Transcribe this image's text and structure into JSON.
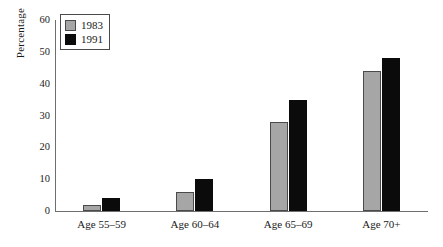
{
  "chart_data": {
    "type": "bar",
    "title": "",
    "subtitle": "",
    "xlabel": "",
    "ylabel": "Percentage",
    "categories": [
      "Age 55–59",
      "Age 60–64",
      "Age 65–69",
      "Age 70+"
    ],
    "series": [
      {
        "name": "1983",
        "color": "#a6a6a6",
        "values": [
          2,
          6,
          28,
          44
        ]
      },
      {
        "name": "1991",
        "color": "#0b0b0b",
        "values": [
          4,
          10,
          35,
          48
        ]
      }
    ],
    "ylim": [
      0,
      60
    ],
    "yticks": [
      0,
      10,
      20,
      30,
      40,
      50,
      60
    ],
    "ytick_labels": [
      "0",
      "10",
      "20",
      "30",
      "40",
      "50",
      "60"
    ],
    "grid": false,
    "legend_position": "top-left",
    "legend_entries": [
      "1983",
      "1991"
    ]
  }
}
